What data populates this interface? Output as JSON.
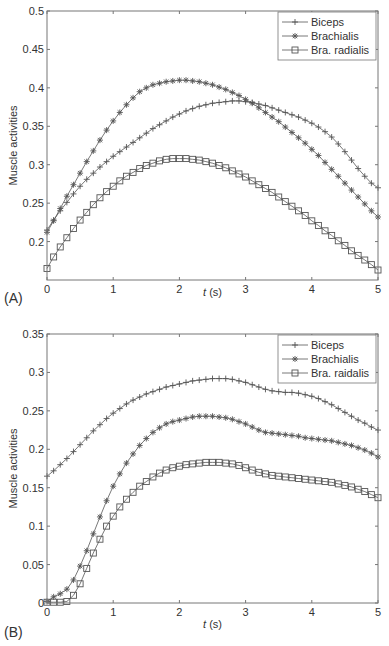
{
  "chart_data": [
    {
      "type": "line",
      "panel": "(A)",
      "title": "",
      "xlabel_italic": "t",
      "xlabel_rest": " (s)",
      "ylabel": "Muscle activities",
      "xlim": [
        0,
        5
      ],
      "ylim": [
        0.15,
        0.5
      ],
      "xticks": [
        0,
        1,
        2,
        3,
        4,
        5
      ],
      "xtick_labels": [
        "0",
        "1",
        "2",
        "3",
        "4",
        "5"
      ],
      "yticks": [
        0.2,
        0.25,
        0.3,
        0.35,
        0.4,
        0.45,
        0.5
      ],
      "ytick_labels": [
        "0.2",
        "0.25",
        "0.3",
        "0.35",
        "0.4",
        "0.45",
        "0.5"
      ],
      "grid": false,
      "legend_position": "top-right",
      "x": [
        0,
        0.1,
        0.2,
        0.3,
        0.4,
        0.5,
        0.6,
        0.7,
        0.8,
        0.9,
        1,
        1.1,
        1.2,
        1.3,
        1.4,
        1.5,
        1.6,
        1.7,
        1.8,
        1.9,
        2,
        2.1,
        2.2,
        2.3,
        2.4,
        2.5,
        2.6,
        2.7,
        2.8,
        2.9,
        3,
        3.1,
        3.2,
        3.3,
        3.4,
        3.5,
        3.6,
        3.7,
        3.8,
        3.9,
        4,
        4.1,
        4.2,
        4.3,
        4.4,
        4.5,
        4.6,
        4.7,
        4.8,
        4.9,
        5
      ],
      "series": [
        {
          "name": "Biceps",
          "marker": "plus",
          "values": [
            0.215,
            0.228,
            0.24,
            0.251,
            0.262,
            0.272,
            0.281,
            0.289,
            0.297,
            0.304,
            0.311,
            0.317,
            0.323,
            0.329,
            0.335,
            0.341,
            0.347,
            0.352,
            0.357,
            0.362,
            0.366,
            0.37,
            0.373,
            0.376,
            0.378,
            0.38,
            0.381,
            0.382,
            0.383,
            0.383,
            0.382,
            0.381,
            0.379,
            0.377,
            0.374,
            0.371,
            0.368,
            0.365,
            0.362,
            0.358,
            0.354,
            0.349,
            0.343,
            0.336,
            0.327,
            0.317,
            0.306,
            0.295,
            0.285,
            0.276,
            0.27
          ]
        },
        {
          "name": "Brachialis",
          "marker": "star",
          "values": [
            0.212,
            0.227,
            0.243,
            0.259,
            0.274,
            0.289,
            0.304,
            0.318,
            0.332,
            0.345,
            0.357,
            0.368,
            0.378,
            0.387,
            0.395,
            0.4,
            0.404,
            0.406,
            0.408,
            0.409,
            0.41,
            0.41,
            0.409,
            0.408,
            0.406,
            0.404,
            0.401,
            0.398,
            0.394,
            0.39,
            0.385,
            0.38,
            0.374,
            0.368,
            0.362,
            0.356,
            0.349,
            0.342,
            0.335,
            0.328,
            0.32,
            0.312,
            0.303,
            0.294,
            0.285,
            0.276,
            0.267,
            0.258,
            0.249,
            0.24,
            0.232
          ]
        },
        {
          "name": "Bra. radialis",
          "marker": "square",
          "values": [
            0.165,
            0.18,
            0.193,
            0.205,
            0.217,
            0.228,
            0.238,
            0.248,
            0.257,
            0.265,
            0.272,
            0.279,
            0.285,
            0.29,
            0.295,
            0.299,
            0.302,
            0.305,
            0.307,
            0.308,
            0.308,
            0.308,
            0.307,
            0.306,
            0.304,
            0.302,
            0.299,
            0.296,
            0.292,
            0.288,
            0.284,
            0.279,
            0.274,
            0.269,
            0.264,
            0.258,
            0.252,
            0.246,
            0.24,
            0.234,
            0.227,
            0.221,
            0.214,
            0.208,
            0.201,
            0.195,
            0.188,
            0.182,
            0.176,
            0.17,
            0.163
          ]
        }
      ]
    },
    {
      "type": "line",
      "panel": "(B)",
      "title": "",
      "xlabel_italic": "t",
      "xlabel_rest": " (s)",
      "ylabel": "Muscle activities",
      "xlim": [
        0,
        5
      ],
      "ylim": [
        0,
        0.35
      ],
      "xticks": [
        0,
        1,
        2,
        3,
        4,
        5
      ],
      "xtick_labels": [
        "0",
        "1",
        "2",
        "3",
        "4",
        "5"
      ],
      "yticks": [
        0,
        0.05,
        0.1,
        0.15,
        0.2,
        0.25,
        0.3,
        0.35
      ],
      "ytick_labels": [
        "0",
        "0.05",
        "0.1",
        "0.15",
        "0.2",
        "0.25",
        "0.3",
        "0.35"
      ],
      "grid": false,
      "legend_position": "top-right",
      "x": [
        0,
        0.1,
        0.2,
        0.3,
        0.4,
        0.5,
        0.6,
        0.7,
        0.8,
        0.9,
        1,
        1.1,
        1.2,
        1.3,
        1.4,
        1.5,
        1.6,
        1.7,
        1.8,
        1.9,
        2,
        2.1,
        2.2,
        2.3,
        2.4,
        2.5,
        2.6,
        2.7,
        2.8,
        2.9,
        3,
        3.1,
        3.2,
        3.3,
        3.4,
        3.5,
        3.6,
        3.7,
        3.8,
        3.9,
        4,
        4.1,
        4.2,
        4.3,
        4.4,
        4.5,
        4.6,
        4.7,
        4.8,
        4.9,
        5
      ],
      "series": [
        {
          "name": "Biceps",
          "marker": "plus",
          "values": [
            0.165,
            0.172,
            0.18,
            0.188,
            0.197,
            0.206,
            0.215,
            0.224,
            0.232,
            0.24,
            0.247,
            0.253,
            0.259,
            0.264,
            0.268,
            0.272,
            0.275,
            0.278,
            0.281,
            0.283,
            0.285,
            0.287,
            0.289,
            0.29,
            0.291,
            0.292,
            0.292,
            0.292,
            0.291,
            0.289,
            0.287,
            0.284,
            0.281,
            0.278,
            0.276,
            0.275,
            0.274,
            0.274,
            0.273,
            0.271,
            0.269,
            0.266,
            0.262,
            0.258,
            0.253,
            0.248,
            0.243,
            0.238,
            0.234,
            0.229,
            0.225
          ]
        },
        {
          "name": "Brachialis",
          "marker": "star",
          "values": [
            0.002,
            0.008,
            0.012,
            0.018,
            0.03,
            0.048,
            0.068,
            0.09,
            0.112,
            0.133,
            0.152,
            0.168,
            0.182,
            0.194,
            0.205,
            0.214,
            0.222,
            0.228,
            0.233,
            0.236,
            0.238,
            0.24,
            0.242,
            0.243,
            0.243,
            0.243,
            0.242,
            0.241,
            0.239,
            0.236,
            0.233,
            0.229,
            0.225,
            0.222,
            0.221,
            0.22,
            0.219,
            0.218,
            0.217,
            0.215,
            0.214,
            0.213,
            0.212,
            0.211,
            0.209,
            0.207,
            0.205,
            0.202,
            0.199,
            0.195,
            0.19
          ]
        },
        {
          "name": "Bra. raidalis",
          "marker": "square",
          "values": [
            0.001,
            0.001,
            0.001,
            0.002,
            0.01,
            0.025,
            0.045,
            0.065,
            0.083,
            0.1,
            0.113,
            0.125,
            0.135,
            0.144,
            0.152,
            0.158,
            0.164,
            0.169,
            0.173,
            0.176,
            0.178,
            0.18,
            0.181,
            0.182,
            0.183,
            0.183,
            0.183,
            0.182,
            0.181,
            0.179,
            0.176,
            0.173,
            0.17,
            0.168,
            0.166,
            0.165,
            0.164,
            0.163,
            0.162,
            0.161,
            0.16,
            0.159,
            0.158,
            0.157,
            0.155,
            0.153,
            0.151,
            0.148,
            0.145,
            0.141,
            0.137
          ]
        }
      ]
    }
  ]
}
